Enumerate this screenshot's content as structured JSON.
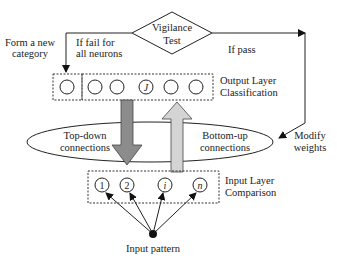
{
  "diagram": {
    "type": "ART neural network flow diagram",
    "vigilance": {
      "line1": "Vigilance",
      "line2": "Test"
    },
    "labels": {
      "form_new_1": "Form a new",
      "form_new_2": "category",
      "fail_1": "If fail for",
      "fail_2": "all neurons",
      "pass": "If pass",
      "output_1": "Output Layer",
      "output_2": "Classification",
      "topdown_1": "Top-down",
      "topdown_2": "connections",
      "bottomup_1": "Bottom-up",
      "bottomup_2": "connections",
      "modify_1": "Modify",
      "modify_2": "weights",
      "input_1": "Input Layer",
      "input_2": "Comparison",
      "input_pattern": "Input pattern"
    },
    "output_nodes": [
      "",
      "",
      "",
      "J",
      "",
      ""
    ],
    "input_nodes": [
      "1",
      "2",
      "i",
      "n"
    ],
    "colors": {
      "topdown_arrow": "#8c8c8c",
      "bottomup_arrow": "#d4d4d4",
      "line": "#222222"
    }
  }
}
